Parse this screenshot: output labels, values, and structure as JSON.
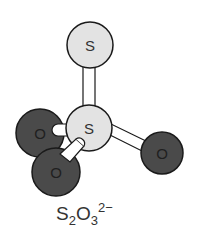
{
  "diagram": {
    "type": "ball-and-stick molecular model",
    "formula": {
      "element1": "S",
      "count1": "2",
      "element2": "O",
      "count2": "3",
      "charge": "2−"
    },
    "atoms": [
      {
        "id": "s_top",
        "label": "S",
        "cx": 90,
        "cy": 45,
        "r": 23,
        "fill": "#e3e3e3"
      },
      {
        "id": "s_center",
        "label": "S",
        "cx": 89,
        "cy": 128,
        "r": 23,
        "fill": "#e3e3e3"
      },
      {
        "id": "o_left",
        "label": "O",
        "cx": 40,
        "cy": 133,
        "r": 24,
        "fill": "#4a4a4a"
      },
      {
        "id": "o_bottom",
        "label": "O",
        "cx": 56,
        "cy": 172,
        "r": 24,
        "fill": "#4a4a4a"
      },
      {
        "id": "o_right",
        "label": "O",
        "cx": 162,
        "cy": 153,
        "r": 21,
        "fill": "#4a4a4a"
      }
    ],
    "bonds": [
      {
        "from": "s_top",
        "to": "s_center"
      },
      {
        "from": "s_center",
        "to": "o_left"
      },
      {
        "from": "s_center",
        "to": "o_bottom"
      },
      {
        "from": "s_center",
        "to": "o_right"
      }
    ],
    "colors": {
      "sulfur": "#e3e3e3",
      "oxygen": "#4a4a4a",
      "outline": "#1a1a1a",
      "bond": "#ffffff"
    }
  }
}
